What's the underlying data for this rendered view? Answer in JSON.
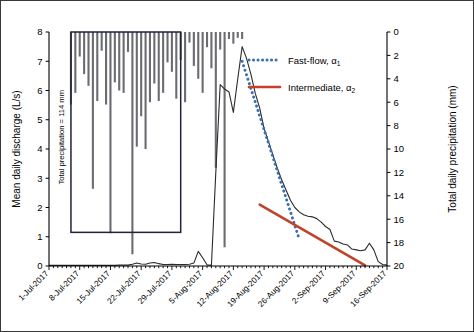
{
  "chart_data": {
    "type": "line",
    "title": "",
    "xlabel": "",
    "ylabel": "Mean daily discharge (L/s)",
    "y2label": "Total daily precipitation (mm)",
    "ylim": [
      0,
      8
    ],
    "y2lim": [
      20,
      0
    ],
    "y2_inverted": true,
    "grid": false,
    "legend_position": "inside-top-right",
    "x_tick_labels": [
      "1-Jul-2017",
      "8-Jul-2017",
      "15-Jul-2017",
      "22-Jul-2017",
      "29-Jul-2017",
      "5-Aug-2017",
      "12-Aug-2017",
      "19-Aug-2017",
      "26-Aug-2017",
      "2-Sep-2017",
      "9-Sep-2017",
      "16-Sep-2017"
    ],
    "x_tick_days": [
      0,
      7,
      14,
      21,
      28,
      35,
      42,
      49,
      56,
      63,
      70,
      77
    ],
    "y_tick_labels": [
      "0",
      "1",
      "2",
      "3",
      "4",
      "5",
      "6",
      "7",
      "8"
    ],
    "y_tick_values": [
      0,
      1,
      2,
      3,
      4,
      5,
      6,
      7,
      8
    ],
    "y2_tick_labels": [
      "0",
      "2",
      "4",
      "6",
      "8",
      "10",
      "12",
      "14",
      "16",
      "18",
      "20"
    ],
    "y2_tick_values": [
      0,
      2,
      4,
      6,
      8,
      10,
      12,
      14,
      16,
      18,
      20
    ],
    "annotations": [
      {
        "name": "total-precipitation-box",
        "label": "Total precipitation = 114 mm",
        "x_start_day": 5,
        "x_end_day": 30,
        "y_top": 8.0,
        "y_bottom": 1.15
      }
    ],
    "series": [
      {
        "name": "Mean daily discharge",
        "type": "line",
        "axis": "left",
        "color": "#2b2b2b",
        "x": [
          0,
          1,
          2,
          3,
          4,
          5,
          6,
          7,
          8,
          9,
          10,
          11,
          12,
          13,
          14,
          15,
          16,
          17,
          18,
          19,
          20,
          21,
          22,
          23,
          24,
          25,
          26,
          27,
          28,
          29,
          30,
          31,
          32,
          33,
          34,
          35,
          36,
          37,
          38,
          39,
          40,
          41,
          42,
          43,
          44,
          45,
          46,
          47,
          48,
          49,
          50,
          51,
          52,
          53,
          54,
          55,
          56,
          57,
          58,
          59,
          60,
          61,
          62,
          63,
          64,
          65,
          66,
          67,
          68,
          69,
          70,
          71,
          72,
          73,
          74,
          75,
          76,
          77
        ],
        "values": [
          0.02,
          0.02,
          0.02,
          0.02,
          0.02,
          0.02,
          0.02,
          0.02,
          0.02,
          0.02,
          0.02,
          0.02,
          0.02,
          0.02,
          0.02,
          0.02,
          0.03,
          0.03,
          0.03,
          0.06,
          0.1,
          0.07,
          0.06,
          0.1,
          0.12,
          0.08,
          0.05,
          0.05,
          0.06,
          0.05,
          0.05,
          0.05,
          0.06,
          0.1,
          0.5,
          0.28,
          0.04,
          0.02,
          3.2,
          6.2,
          6.05,
          5.95,
          5.25,
          6.4,
          7.5,
          7.1,
          6.55,
          5.9,
          5.4,
          4.7,
          4.25,
          3.8,
          3.35,
          2.95,
          2.6,
          2.25,
          2.0,
          1.85,
          1.75,
          1.7,
          1.68,
          1.62,
          1.5,
          1.35,
          1.25,
          0.85,
          0.82,
          0.75,
          0.72,
          0.58,
          0.55,
          0.52,
          0.55,
          0.78,
          0.55,
          0.15,
          0.05,
          0.03
        ]
      },
      {
        "name": "Fast-flow, α₁",
        "type": "trendline",
        "axis": "left",
        "color": "#3a6fb0",
        "style": "dotted",
        "x_start_day": 44,
        "y_start": 7.0,
        "x_end_day": 57,
        "y_end": 0.92
      },
      {
        "name": "Intermediate, α₂",
        "type": "trendline",
        "axis": "left",
        "color": "#c0432a",
        "style": "solid",
        "x_start_day": 48,
        "y_start": 2.1,
        "x_end_day": 72,
        "y_end": 0.02
      },
      {
        "name": "Total daily precipitation",
        "type": "bar",
        "axis": "right",
        "color": "#6b6b72",
        "x": [
          5,
          6,
          7,
          8,
          9,
          10,
          11,
          12,
          13,
          14,
          15,
          16,
          17,
          18,
          19,
          20,
          21,
          22,
          23,
          24,
          25,
          26,
          27,
          28,
          29,
          30,
          31,
          32,
          33,
          34,
          35,
          36,
          37,
          38,
          39,
          40,
          41,
          42,
          43,
          44
        ],
        "values": [
          6.2,
          5.2,
          2.1,
          3.6,
          4.6,
          13.4,
          5.9,
          1.6,
          6.2,
          17.2,
          4.3,
          5.0,
          5.2,
          1.7,
          19.0,
          9.8,
          7.2,
          10.0,
          6.0,
          4.4,
          5.9,
          5.2,
          2.6,
          3.4,
          5.7,
          2.4,
          6.0,
          0.9,
          2.9,
          4.0,
          5.2,
          1.3,
          3.1,
          11.6,
          1.5,
          18.4,
          0.6,
          1.0,
          0.5,
          0.6
        ]
      }
    ],
    "legend": [
      {
        "label": "Fast-flow, α",
        "sub": "1",
        "color": "#3a6fb0",
        "style": "dotted"
      },
      {
        "label": "Intermediate, α",
        "sub": "2",
        "color": "#c0432a",
        "style": "solid"
      }
    ]
  }
}
